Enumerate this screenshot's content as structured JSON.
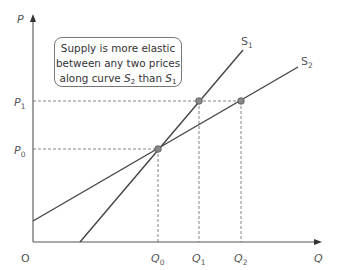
{
  "annotation": {
    "line1": "Supply is more elastic",
    "line2": "between any two prices",
    "line3_prefix": "along curve ",
    "curve_a": "S",
    "curve_a_sub": "2",
    "middle": " than ",
    "curve_b": "S",
    "curve_b_sub": "1"
  },
  "axes": {
    "y_label": "P",
    "x_label": "Q",
    "origin": "O"
  },
  "labels": {
    "p0": "P",
    "p0_sub": "0",
    "p1": "P",
    "p1_sub": "1",
    "q0": "Q",
    "q0_sub": "0",
    "q1": "Q",
    "q1_sub": "1",
    "q2": "Q",
    "q2_sub": "2",
    "s1": "S",
    "s1_sub": "1",
    "s2": "S",
    "s2_sub": "2"
  },
  "colors": {
    "line": "#444444",
    "dash": "#777777",
    "point": "#888888"
  }
}
